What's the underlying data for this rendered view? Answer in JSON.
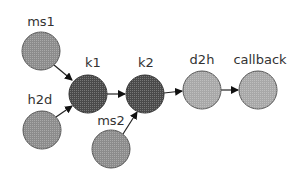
{
  "diagram": {
    "nodes": [
      {
        "id": "ms1",
        "label": "ms1",
        "x": 41,
        "y": 51,
        "fill": "#8c8c8c"
      },
      {
        "id": "h2d",
        "label": "h2d",
        "x": 42,
        "y": 130,
        "fill": "#8c8c8c"
      },
      {
        "id": "k1",
        "label": "k1",
        "x": 88,
        "y": 94,
        "fill": "#4a4a4a"
      },
      {
        "id": "k2",
        "label": "k2",
        "x": 145,
        "y": 94,
        "fill": "#4a4a4a"
      },
      {
        "id": "ms2",
        "label": "ms2",
        "x": 111,
        "y": 149,
        "fill": "#8c8c8c"
      },
      {
        "id": "d2h",
        "label": "d2h",
        "x": 202,
        "y": 90,
        "fill": "#a8a8a8"
      },
      {
        "id": "callback",
        "label": "callback",
        "x": 258,
        "y": 90,
        "fill": "#a8a8a8"
      }
    ],
    "edges": [
      {
        "from": "ms1",
        "to": "k1"
      },
      {
        "from": "h2d",
        "to": "k1"
      },
      {
        "from": "k1",
        "to": "k2"
      },
      {
        "from": "ms2",
        "to": "k2"
      },
      {
        "from": "k2",
        "to": "d2h"
      },
      {
        "from": "d2h",
        "to": "callback"
      }
    ]
  }
}
